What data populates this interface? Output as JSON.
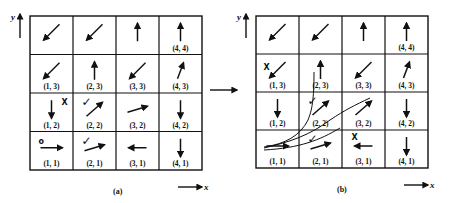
{
  "figure": {
    "panels": [
      {
        "id": "a",
        "caption": "(a)",
        "origin": [
          30,
          16
        ],
        "cell_w": 43,
        "cell_h": 38.5,
        "axis_x_label": "x",
        "axis_y_label": "y",
        "cells": [
          {
            "label": "",
            "col": 1,
            "row": 4,
            "arrow": "down-left"
          },
          {
            "label": "",
            "col": 2,
            "row": 4,
            "arrow": "down-left"
          },
          {
            "label": "",
            "col": 3,
            "row": 4,
            "arrow": "up"
          },
          {
            "label": "(4, 4)",
            "col": 4,
            "row": 4,
            "arrow": "up"
          },
          {
            "label": "(1, 3)",
            "col": 1,
            "row": 3,
            "arrow": "down-left"
          },
          {
            "label": "(2, 3)",
            "col": 2,
            "row": 3,
            "arrow": "up"
          },
          {
            "label": "(3, 3)",
            "col": 3,
            "row": 3,
            "arrow": "down-left"
          },
          {
            "label": "(4, 3)",
            "col": 4,
            "row": 3,
            "arrow": "up-right-steep"
          },
          {
            "label": "(1, 2)",
            "col": 1,
            "row": 2,
            "arrow": "down",
            "mark": "X"
          },
          {
            "label": "(2, 2)",
            "col": 2,
            "row": 2,
            "arrow": "up-right",
            "mark": "✓"
          },
          {
            "label": "(3, 2)",
            "col": 3,
            "row": 2,
            "arrow": "right-up-shallow"
          },
          {
            "label": "(4, 2)",
            "col": 4,
            "row": 2,
            "arrow": "down"
          },
          {
            "label": "(1, 1)",
            "col": 1,
            "row": 1,
            "arrow": "right",
            "mark": "o"
          },
          {
            "label": "(2, 1)",
            "col": 2,
            "row": 1,
            "arrow": "right-up-shallow",
            "mark": "✓"
          },
          {
            "label": "(3, 1)",
            "col": 3,
            "row": 1,
            "arrow": "left"
          },
          {
            "label": "(4, 1)",
            "col": 4,
            "row": 1,
            "arrow": "down"
          }
        ]
      },
      {
        "id": "b",
        "caption": "(b)",
        "origin": [
          256,
          16
        ],
        "cell_w": 43,
        "cell_h": 38,
        "axis_x_label": "x",
        "axis_y_label": "y",
        "cells": [
          {
            "label": "",
            "col": 1,
            "row": 4,
            "arrow": "down-left"
          },
          {
            "label": "",
            "col": 2,
            "row": 4,
            "arrow": "down-left"
          },
          {
            "label": "",
            "col": 3,
            "row": 4,
            "arrow": "up"
          },
          {
            "label": "(4, 4)",
            "col": 4,
            "row": 4,
            "arrow": "up"
          },
          {
            "label": "(1, 3)",
            "col": 1,
            "row": 3,
            "arrow": "down-left",
            "mark": "X"
          },
          {
            "label": "(2, 3)",
            "col": 2,
            "row": 3,
            "arrow": "up"
          },
          {
            "label": "(3, 3)",
            "col": 3,
            "row": 3,
            "arrow": "down-left"
          },
          {
            "label": "(4, 3)",
            "col": 4,
            "row": 3,
            "arrow": "up-right-steep"
          },
          {
            "label": "(1, 2)",
            "col": 1,
            "row": 2,
            "arrow": "down"
          },
          {
            "label": "(2, 2)",
            "col": 2,
            "row": 2,
            "arrow": "up-right",
            "mark": "✓"
          },
          {
            "label": "(3, 2)",
            "col": 3,
            "row": 2,
            "arrow": "up-right"
          },
          {
            "label": "(4, 2)",
            "col": 4,
            "row": 2,
            "arrow": "down"
          },
          {
            "label": "(1, 1)",
            "col": 1,
            "row": 1,
            "arrow": "right"
          },
          {
            "label": "(2, 1)",
            "col": 2,
            "row": 1,
            "arrow": "right-up-shallow",
            "mark": "✓"
          },
          {
            "label": "(3, 1)",
            "col": 3,
            "row": 1,
            "arrow": "left",
            "mark": "X"
          },
          {
            "label": "(4, 1)",
            "col": 4,
            "row": 1,
            "arrow": "down"
          }
        ]
      }
    ],
    "transition_arrow": "→"
  }
}
